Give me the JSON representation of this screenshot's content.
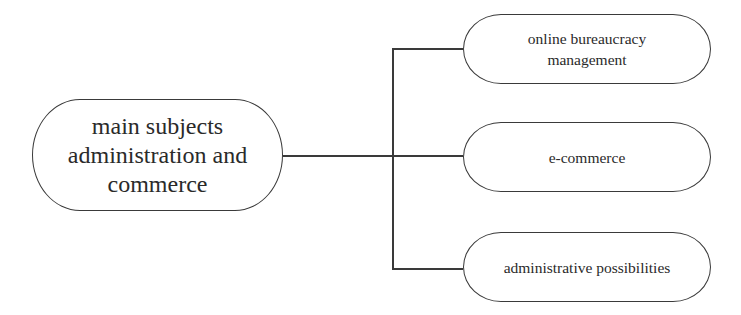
{
  "diagram": {
    "type": "mind-map",
    "root": {
      "label": "main subjects administration and commerce",
      "lines": [
        "main subjects",
        "administration and",
        "commerce"
      ]
    },
    "children": [
      {
        "label": "online bureaucracy management",
        "lines": [
          "online bureaucracy",
          "management"
        ]
      },
      {
        "label": "e-commerce",
        "lines": [
          "e-commerce"
        ]
      },
      {
        "label": "administrative possibilities",
        "lines": [
          "administrative possibilities"
        ]
      }
    ],
    "colors": {
      "stroke": "#3a3a3a",
      "text": "#2a2a2a",
      "background": "#ffffff"
    }
  }
}
